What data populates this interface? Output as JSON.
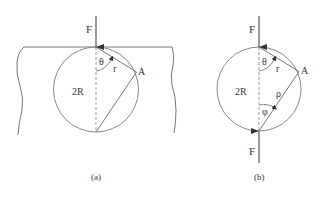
{
  "figure": {
    "panel_a": {
      "caption": "(a)",
      "force_label": "F",
      "angle_label": "θ",
      "chord_label": "r",
      "point_label": "A",
      "diameter_label": "2R"
    },
    "panel_b": {
      "caption": "(b)",
      "force_top_label": "F",
      "force_bottom_label": "F",
      "angle_theta_label": "θ",
      "chord_r_label": "r",
      "angle_phi_label": "φ",
      "chord_rho_label": "ρ",
      "point_label": "A",
      "diameter_label": "2R"
    },
    "colors": {
      "stroke": "#777777",
      "text": "#333333",
      "arrow": "#555555"
    }
  }
}
